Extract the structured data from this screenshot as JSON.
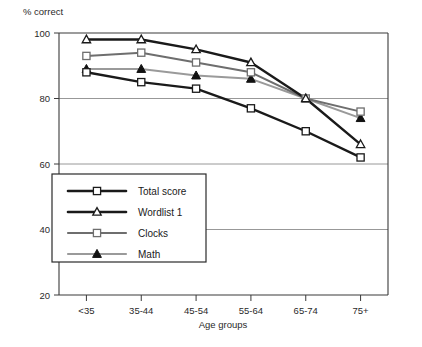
{
  "chart_data": {
    "type": "line",
    "title": "% correct",
    "xlabel": "Age groups",
    "ylabel": "",
    "categories": [
      "<35",
      "35-44",
      "45-54",
      "55-64",
      "65-74",
      "75+"
    ],
    "ylim": [
      20,
      100
    ],
    "yticks": [
      20,
      40,
      60,
      80,
      100
    ],
    "grid": true,
    "grid_axis": "y",
    "legend_position": "lower-left-inside",
    "series": [
      {
        "name": "Total score",
        "marker": "open-square",
        "color": "#1a1a1a",
        "values": [
          88,
          85,
          83,
          77,
          70,
          62
        ]
      },
      {
        "name": "Wordlist 1",
        "marker": "open-triangle",
        "color": "#1a1a1a",
        "values": [
          98,
          98,
          95,
          91,
          80,
          66
        ]
      },
      {
        "name": "Clocks",
        "marker": "open-square",
        "color": "#6e6e6e",
        "values": [
          93,
          94,
          91,
          88,
          80,
          76
        ]
      },
      {
        "name": "Math",
        "marker": "filled-triangle",
        "color": "#9a9a9a",
        "values": [
          89,
          89,
          87,
          86,
          80,
          74
        ]
      }
    ]
  },
  "axis": {
    "y_tick_labels": [
      "100",
      "80",
      "60",
      "40",
      "20"
    ],
    "x_tick_labels": [
      "<35",
      "35-44",
      "45-54",
      "55-64",
      "65-74",
      "75+"
    ],
    "x_axis_title": "Age groups",
    "y_axis_title": "% correct"
  },
  "legend": {
    "entries": [
      {
        "label": "Total score"
      },
      {
        "label": "Wordlist 1"
      },
      {
        "label": "Clocks"
      },
      {
        "label": "Math"
      }
    ]
  },
  "colors": {
    "line_dark": "#1a1a1a",
    "line_mid": "#6e6e6e",
    "line_light": "#9a9a9a",
    "grid": "#8c8c8c",
    "frame": "#3a3a3a",
    "background": "#ffffff"
  }
}
